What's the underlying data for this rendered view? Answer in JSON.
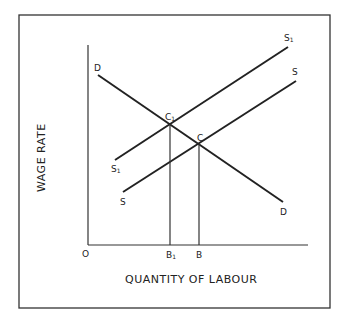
{
  "diagram": {
    "y_axis_label": "WAGE RATE",
    "x_axis_label": "QUANTITY OF LABOUR",
    "origin_label": "O",
    "curves": {
      "demand": {
        "start_label": "D",
        "end_label": "D"
      },
      "supply": {
        "start_label": "S",
        "end_label": "S"
      },
      "supply_shifted": {
        "start_label": "S",
        "start_sub": "1",
        "end_label": "S",
        "end_sub": "1"
      }
    },
    "points": {
      "c": "C",
      "c1": "C",
      "c1_sub": "1"
    },
    "ticks": {
      "b": "B",
      "b1": "B",
      "b1_sub": "1"
    },
    "colors": {
      "line": "#222222",
      "frame": "#333333"
    }
  }
}
